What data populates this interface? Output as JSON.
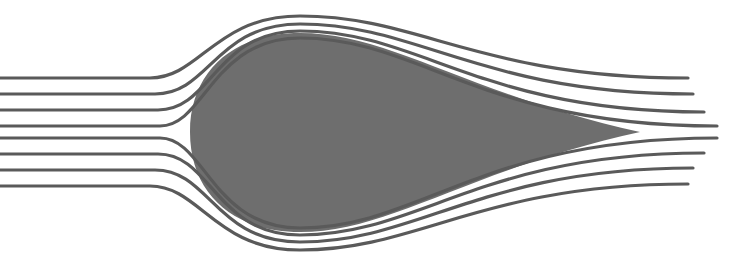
{
  "diagram": {
    "colors": {
      "background": "#ffffff",
      "body_fill": "#6e6e6e",
      "streamline": "#5a5a5a"
    },
    "body": {
      "shape": "teardrop",
      "nose_x": 190,
      "top_y": 33,
      "bottom_y": 232,
      "tail_x": 640,
      "tail_y": 132
    },
    "streamline_count": 8,
    "streamlines": [
      {
        "id": "upper-1",
        "d": "M0 78 L150 78 C200 78 215 16 300 16 C420 16 480 78 688 78"
      },
      {
        "id": "upper-2",
        "d": "M0 94 L155 94 C210 94 215 24 300 24 C420 24 480 94 693 94"
      },
      {
        "id": "upper-3",
        "d": "M0 110 L158 110 C212 110 215 31 300 31 C420 31 480 112 704 112"
      },
      {
        "id": "upper-4",
        "d": "M0 126 L160 126 C205 126 212 38 300 38 C420 38 480 126 717 126"
      },
      {
        "id": "lower-4",
        "d": "M0 138 L160 138 C205 138 212 228 300 228 C420 228 480 138 717 138"
      },
      {
        "id": "lower-3",
        "d": "M0 154 L158 154 C212 154 215 235 300 235 C420 235 480 153 704 153"
      },
      {
        "id": "lower-2",
        "d": "M0 170 L155 170 C210 170 215 242 300 242 C420 242 480 168 693 168"
      },
      {
        "id": "lower-1",
        "d": "M0 186 L150 186 C200 186 215 250 300 250 C420 250 480 184 688 184"
      }
    ]
  }
}
